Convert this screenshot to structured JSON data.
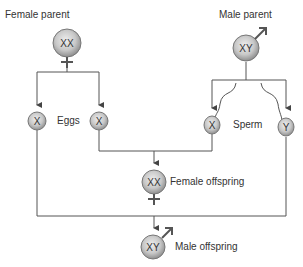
{
  "diagram": {
    "type": "sex-chromosome inheritance",
    "colors": {
      "line": "#555555",
      "circle_fill_center": "#e4e4e4",
      "circle_fill_edge": "#9a9a9a",
      "circle_stroke": "#777777",
      "symbol": "#555555",
      "text": "#333333"
    },
    "female_parent": {
      "label": "Female parent",
      "chromosomes": "XX",
      "symbol": "female-symbol"
    },
    "male_parent": {
      "label": "Male parent",
      "chromosomes": "XY",
      "symbol": "male-symbol"
    },
    "eggs": {
      "label": "Eggs",
      "items": [
        {
          "chromosome": "X"
        },
        {
          "chromosome": "X"
        }
      ]
    },
    "sperm": {
      "label": "Sperm",
      "items": [
        {
          "chromosome": "X"
        },
        {
          "chromosome": "Y"
        }
      ]
    },
    "female_offspring": {
      "label": "Female offspring",
      "chromosomes": "XX",
      "symbol": "female-symbol"
    },
    "male_offspring": {
      "label": "Male offspring",
      "chromosomes": "XY",
      "symbol": "male-symbol"
    }
  }
}
